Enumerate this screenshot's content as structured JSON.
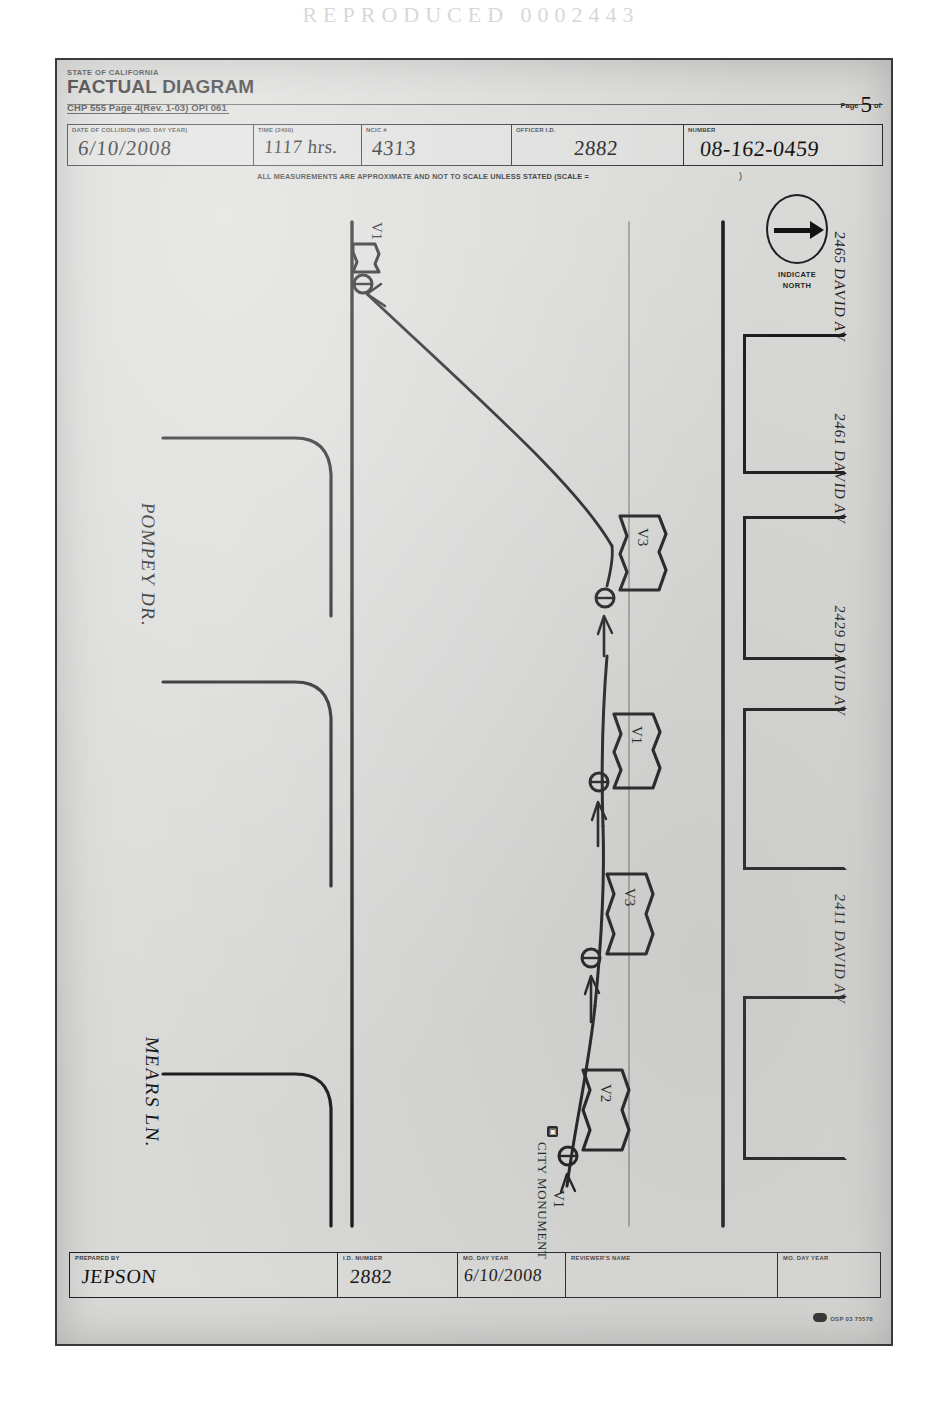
{
  "scan_header": "REPRODUCED 0002443",
  "form": {
    "agency": "STATE OF CALIFORNIA",
    "title": "FACTUAL DIAGRAM",
    "subtitle": "CHP 555 Page 4(Rev. 1-03) OPI 061",
    "page_label": "Page",
    "page_number": "5",
    "page_of": "of"
  },
  "fields": [
    {
      "label": "DATE OF COLLISION (MO.   DAY     YEAR)",
      "value": "6/10/2008",
      "name": "date-of-collision"
    },
    {
      "label": "TIME (2400)",
      "value": "1117 hrs.",
      "name": "time-of-collision"
    },
    {
      "label": "NCIC #",
      "value": "4313",
      "name": "ncic-number"
    },
    {
      "label": "OFFICER I.D.",
      "value": "2882",
      "name": "officer-id"
    },
    {
      "label": "NUMBER",
      "value": "08-162-0459",
      "name": "report-number"
    }
  ],
  "scale_note": {
    "text": "ALL MEASUREMENTS ARE APPROXIMATE AND NOT TO SCALE UNLESS STATED  (SCALE =",
    "close_paren": ")"
  },
  "compass": {
    "line1": "INDICATE",
    "line2": "NORTH",
    "icon": "north-arrow-icon"
  },
  "streets": [
    {
      "name": "street-label-pompey",
      "label": "POMPEY DR."
    },
    {
      "name": "street-label-mears",
      "label": "MEARS LN."
    }
  ],
  "parcels": [
    {
      "name": "parcel-2465",
      "address": "2465 DAVID AV"
    },
    {
      "name": "parcel-2461",
      "address": "2461 DAVID AV"
    },
    {
      "name": "parcel-2429",
      "address": "2429 DAVID AV"
    },
    {
      "name": "parcel-2411",
      "address": "2411 DAVID AV"
    }
  ],
  "vehicles": [
    {
      "name": "vehicle-v3-upper",
      "label": "V3"
    },
    {
      "name": "vehicle-v1",
      "label": "V1"
    },
    {
      "name": "vehicle-v3-lower",
      "label": "V3"
    },
    {
      "name": "vehicle-v2",
      "label": "V2"
    }
  ],
  "path_labels": [
    {
      "name": "path-label-v1",
      "label": "V1"
    },
    {
      "name": "path-label-final-rest",
      "label": "V1"
    }
  ],
  "monument": {
    "symbol": "city-monument-icon",
    "label": "CITY MONUMENT"
  },
  "footer": [
    {
      "name": "prepared-by",
      "label": "PREPARED BY",
      "value": "JEPSON"
    },
    {
      "name": "id-number",
      "label": "I.D. NUMBER",
      "value": "2882"
    },
    {
      "name": "review-date",
      "label": "MO.     DAY     YEAR",
      "value": "6/10/2008"
    },
    {
      "name": "reviewers-name",
      "label": "REVIEWER'S NAME",
      "value": ""
    },
    {
      "name": "reviewer-date",
      "label": "MO.     DAY     YEAR",
      "value": ""
    }
  ],
  "op_code": "OSP 03 75578",
  "colors": {
    "ink": "#111111",
    "paper": "#d9d9d7",
    "rule": "#2b2b2b"
  }
}
